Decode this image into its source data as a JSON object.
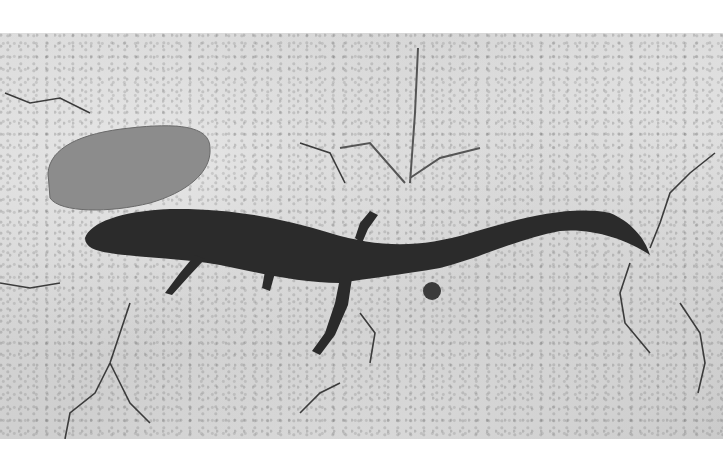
{
  "image": {
    "subject": "lizard on cracked dry ground",
    "style": "black-and-white photograph",
    "colors": {
      "background": "#ffffff",
      "ground": "#d4d4d4",
      "lizard": "#2a2a2a",
      "rock": "#8a8a8a",
      "cracks": "#3a3a3a"
    }
  }
}
